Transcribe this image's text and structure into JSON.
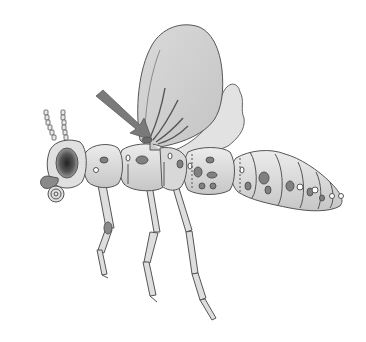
{
  "figure": {
    "subject": "Insect illustration (wasp-like) with arrow pointing to wing base",
    "parts": [
      "antennae",
      "head",
      "eye",
      "mouthparts",
      "thorax",
      "wing",
      "arrow",
      "abdomen",
      "legs"
    ],
    "colors": {
      "background": "#ffffff",
      "outline": "#555555",
      "body_light": "#e2e2e2",
      "body_mid": "#c8c8c8",
      "wing": "#d0d0d0",
      "wing_light": "#e4e4e4",
      "spot": "#808080",
      "arrow": "#7a7a7a",
      "eye_dark": "#3a3a3a"
    }
  }
}
